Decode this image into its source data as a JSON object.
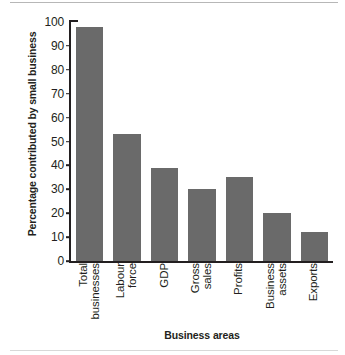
{
  "chart_data": {
    "type": "bar",
    "title": "",
    "xlabel": "Business areas",
    "ylabel": "Percentage contributed by small business",
    "categories": [
      "Total businesses",
      "Labour force",
      "GDP",
      "Gross sales",
      "Profits",
      "Business assets",
      "Exports"
    ],
    "category_lines": [
      [
        "Total",
        "businesses"
      ],
      [
        "Labour",
        "force"
      ],
      [
        "GDP"
      ],
      [
        "Gross",
        "sales"
      ],
      [
        "Profits"
      ],
      [
        "Business",
        "assets"
      ],
      [
        "Exports"
      ]
    ],
    "values": [
      98,
      53,
      39,
      30,
      35,
      20,
      12
    ],
    "ylim": [
      0,
      100
    ],
    "yticks": [
      0,
      10,
      20,
      30,
      40,
      50,
      60,
      70,
      80,
      90,
      100
    ],
    "ytick_labels": [
      "0",
      "10",
      "20",
      "30",
      "40",
      "50",
      "60",
      "70",
      "80",
      "90",
      "100"
    ],
    "grid": false,
    "legend": null,
    "bar_color": "#6a6a6a",
    "axis_color": "#231f20",
    "background": "#ffffff"
  }
}
